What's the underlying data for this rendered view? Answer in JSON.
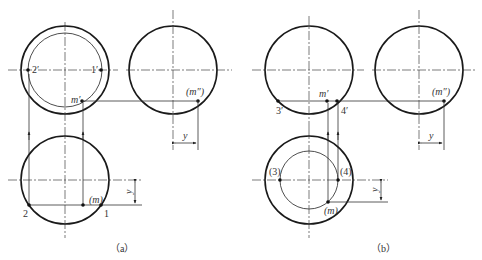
{
  "figure": {
    "panel_a": {
      "caption": "（a）",
      "front_view": {
        "center": [
          65,
          70
        ],
        "outer_r": 44,
        "inner_r": 37
      },
      "side_view": {
        "center": [
          173,
          70
        ],
        "r": 44
      },
      "top_view": {
        "center": [
          65,
          180
        ],
        "r": 44
      },
      "labels": {
        "p2_prime": "2′",
        "p1_prime": "1′",
        "m_prime": "m′",
        "m_double_prime": "(m″)",
        "p2": "2",
        "p1": "1",
        "m": "(m)",
        "dim_y_side": "y",
        "dim_y_top": "y"
      }
    },
    "panel_b": {
      "caption": "（b）",
      "front_view": {
        "center": [
          309,
          70
        ],
        "r": 44
      },
      "side_view": {
        "center": [
          419,
          70
        ],
        "r": 44
      },
      "top_view": {
        "center": [
          309,
          180
        ],
        "outer_r": 44,
        "inner_r": 29
      },
      "labels": {
        "p3_prime": "3′",
        "p4_prime": "4′",
        "m_prime": "m′",
        "m_double_prime": "(m″)",
        "p3": "(3)",
        "p4": "(4)",
        "m": "(m)",
        "dim_y_side": "y",
        "dim_y_top": "y"
      }
    }
  }
}
